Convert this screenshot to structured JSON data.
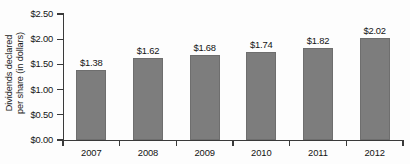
{
  "chart_data": {
    "type": "bar",
    "title": "",
    "subtitle": "",
    "xlabel": "",
    "ylabel": "Dividends declared per share (in dollars)",
    "ylabel_lines": [
      "Dividends declared",
      "per share (in dollars)"
    ],
    "categories": [
      "2007",
      "2008",
      "2009",
      "2010",
      "2011",
      "2012"
    ],
    "values": [
      1.38,
      1.62,
      1.68,
      1.74,
      1.82,
      2.02
    ],
    "data_labels": [
      "$1.38",
      "$1.62",
      "$1.68",
      "$1.74",
      "$1.82",
      "$2.02"
    ],
    "ylim": [
      0,
      2.5
    ],
    "ytick_values": [
      0,
      0.5,
      1.0,
      1.5,
      2.0,
      2.5
    ],
    "ytick_labels": [
      "$0.00",
      "$0.50",
      "$1.00",
      "$1.50",
      "$2.00",
      "$2.50"
    ],
    "grid": false,
    "legend": null,
    "legend_position": "none",
    "bar_color": "#7d7d7d",
    "axis_color": "#3a3a3a",
    "text_color": "#141414",
    "background_color": "#fdfdfd"
  }
}
